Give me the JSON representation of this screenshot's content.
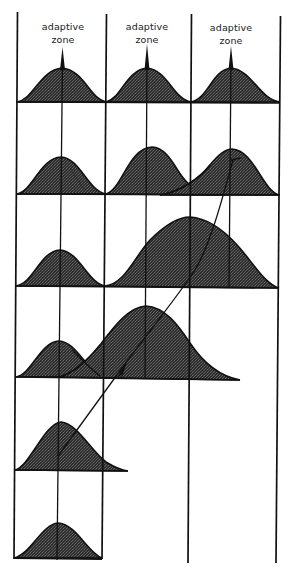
{
  "figure": {
    "type": "diagram",
    "columns": [
      {
        "label_line1": "adaptive",
        "label_line2": "zone"
      },
      {
        "label_line1": "adaptive",
        "label_line2": "zone"
      },
      {
        "label_line1": "adaptive",
        "label_line2": "zone"
      }
    ],
    "colors": {
      "ink": "#111111",
      "fill": "#3a3a3a",
      "background": "#ffffff"
    },
    "rows": [
      {
        "index": 1,
        "distributions": [
          "col1",
          "col2",
          "col3"
        ],
        "note": "top row; each zone has a narrow spike at its center"
      },
      {
        "index": 2,
        "distributions": [
          "col1",
          "col2",
          "col3"
        ],
        "note": "col2 tail overlaps col3 distribution; arrow ends here"
      },
      {
        "index": 3,
        "distributions": [
          "col1",
          "col2-wide"
        ],
        "note": "wide distribution centered on col2/col3 border"
      },
      {
        "index": 4,
        "distributions": [
          "col1",
          "col1-col2-wide"
        ],
        "note": "wide distribution centered at col2 zone; arrowhead"
      },
      {
        "index": 5,
        "distributions": [
          "col1-skewed"
        ],
        "note": "arrow starts here"
      },
      {
        "index": 6,
        "distributions": [
          "col1-narrow"
        ],
        "note": "bottom row, ancestral population"
      }
    ],
    "arrow": {
      "from": "row5-col1",
      "to": "row2-col3"
    }
  }
}
